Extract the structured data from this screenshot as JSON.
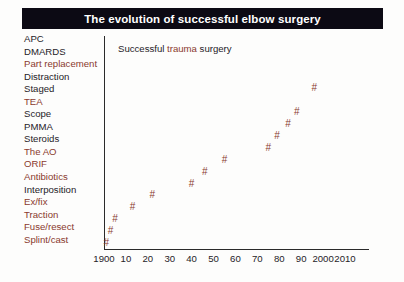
{
  "title": {
    "text": "The evolution of successful elbow surgery"
  },
  "labels": [
    {
      "text": "APC",
      "color": "dark"
    },
    {
      "text": "DMARDS",
      "color": "dark"
    },
    {
      "text": "Part replacement",
      "color": "red"
    },
    {
      "text": "Distraction",
      "color": "dark"
    },
    {
      "text": "Staged",
      "color": "dark"
    },
    {
      "text": "TEA",
      "color": "red"
    },
    {
      "text": "Scope",
      "color": "dark"
    },
    {
      "text": "PMMA",
      "color": "dark"
    },
    {
      "text": "Steroids",
      "color": "dark"
    },
    {
      "text": "The AO",
      "color": "red"
    },
    {
      "text": "ORIF",
      "color": "red"
    },
    {
      "text": "Antibiotics",
      "color": "red"
    },
    {
      "text": "Interposition",
      "color": "dark"
    },
    {
      "text": "Ex/fix",
      "color": "red"
    },
    {
      "text": "Traction",
      "color": "red"
    },
    {
      "text": "Fuse/resect",
      "color": "red"
    },
    {
      "text": "Splint/cast",
      "color": "red"
    }
  ],
  "annotation": {
    "prefix": "Successful ",
    "highlight": "trauma",
    "suffix": " surgery"
  },
  "colors": {
    "title_bar": "#0c0a14",
    "title_text": "#ffffff",
    "accent_red": "#8a3a2e",
    "text_dark": "#262228",
    "axis": "#2a2a2a",
    "background": "#fdfdfc"
  },
  "chart_data": {
    "type": "scatter",
    "title": "The evolution of successful elbow surgery",
    "xlabel": "",
    "ylabel": "",
    "xlim": [
      1900,
      2010
    ],
    "ylim": [
      0,
      17
    ],
    "grid": false,
    "legend": null,
    "marker": "#",
    "marker_color": "#8a3a2e",
    "annotations": [
      {
        "text": "Successful trauma surgery",
        "x": 1906,
        "y": 16.2
      }
    ],
    "xticks": [
      {
        "value": 1900,
        "label": "1900"
      },
      {
        "value": 1910,
        "label": "10"
      },
      {
        "value": 1920,
        "label": "20"
      },
      {
        "value": 1930,
        "label": "30"
      },
      {
        "value": 1940,
        "label": "40"
      },
      {
        "value": 1950,
        "label": "50"
      },
      {
        "value": 1960,
        "label": "60"
      },
      {
        "value": 1970,
        "label": "70"
      },
      {
        "value": 1980,
        "label": "80"
      },
      {
        "value": 1990,
        "label": "90"
      },
      {
        "value": 2000,
        "label": "2000"
      },
      {
        "value": 2010,
        "label": "2010"
      }
    ],
    "yticks": [],
    "ytick_labels_as_list": [
      "Splint/cast",
      "Fuse/resect",
      "Traction",
      "Ex/fix",
      "Interposition",
      "Antibiotics",
      "ORIF",
      "The AO",
      "Steroids",
      "PMMA",
      "Scope",
      "TEA",
      "Staged",
      "Distraction",
      "Part replacement",
      "DMARDS",
      "APC"
    ],
    "points": [
      {
        "x": 1901,
        "y": 1,
        "label": "Splint/cast"
      },
      {
        "x": 1903,
        "y": 2,
        "label": "Fuse/resect"
      },
      {
        "x": 1905,
        "y": 3,
        "label": "Traction"
      },
      {
        "x": 1913,
        "y": 4,
        "label": "Ex/fix"
      },
      {
        "x": 1922,
        "y": 5,
        "label": "Interposition"
      },
      {
        "x": 1940,
        "y": 6,
        "label": "Antibiotics"
      },
      {
        "x": 1946,
        "y": 7,
        "label": "ORIF"
      },
      {
        "x": 1955,
        "y": 8,
        "label": "The AO"
      },
      {
        "x": 1975,
        "y": 9,
        "label": "Steroids"
      },
      {
        "x": 1979,
        "y": 10,
        "label": "PMMA"
      },
      {
        "x": 1984,
        "y": 11,
        "label": "Scope"
      },
      {
        "x": 1988,
        "y": 12,
        "label": "TEA"
      },
      {
        "x": 1996,
        "y": 14,
        "label": "Distraction"
      }
    ]
  }
}
